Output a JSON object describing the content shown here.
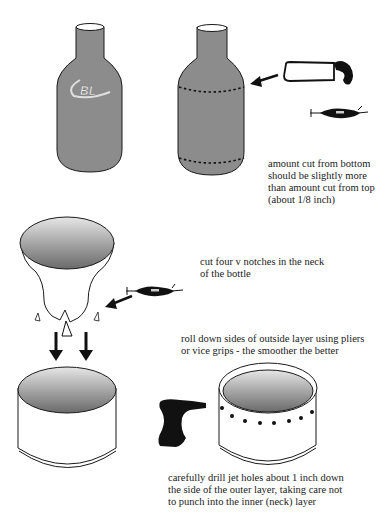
{
  "figure": {
    "steps": [
      {
        "id": "step-1",
        "caption": "amount cut from bottom\nshould be slightly more\nthan amount cut from top\n(about 1/8 inch)"
      },
      {
        "id": "step-2",
        "caption": "cut four v notches in the neck\nof the bottle"
      },
      {
        "id": "step-3",
        "caption": "roll down sides of outside layer using pliers\nor vice grips - the smoother the better"
      },
      {
        "id": "step-4",
        "caption": "carefully drill jet holes about 1 inch down\nthe side of the outer layer, taking care not\nto punch into the inner (neck) layer"
      }
    ],
    "bottle_logo": "BL",
    "colors": {
      "bottle_fill": "#8c8c8c",
      "outline": "#1a1a1a",
      "background": "#ffffff"
    }
  }
}
